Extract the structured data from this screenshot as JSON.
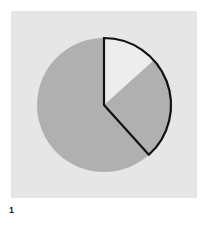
{
  "figure": {
    "caption": "1",
    "panel_background": "#e6e6e6",
    "page_background": "#ffffff"
  },
  "chart_data": {
    "type": "pie",
    "title": "",
    "subtitle": "",
    "xlabel": "",
    "ylabel": "",
    "legend": [],
    "grid": false,
    "start_angle_deg": 0,
    "direction": "clockwise",
    "center": {
      "x": 93,
      "y": 94
    },
    "radius": 67,
    "categories": [
      "Segment A",
      "Segment B",
      "Segment C"
    ],
    "values": [
      61.5,
      25.0,
      13.5
    ],
    "labels": [
      "",
      "",
      ""
    ],
    "slice_colors": [
      "#b0b0b0",
      "#b0b0b0",
      "#ededed"
    ],
    "slice_angles_deg": [
      {
        "start": 138,
        "end": 360
      },
      {
        "start": 48,
        "end": 138
      },
      {
        "start": 0,
        "end": 48
      }
    ],
    "exploded_group": {
      "outline_color": "#111111",
      "outline_width": 2,
      "start_angle_deg": 0,
      "end_angle_deg": 138,
      "fraction": 0.385
    },
    "annotations": [
      {
        "text": "1",
        "position": "below-left",
        "bold": true
      }
    ]
  },
  "colors": {
    "panel": "#e6e6e6",
    "slice_gray": "#b0b0b0",
    "slice_white": "#ededed",
    "outline": "#111111",
    "caption_text": "#1a1a1a"
  }
}
